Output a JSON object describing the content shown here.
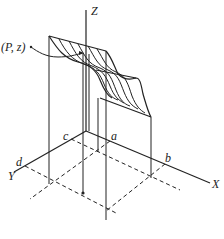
{
  "figure": {
    "type": "3D joint distribution surface diagram",
    "axes": {
      "z_label": "Z",
      "x_label": "X",
      "y_label": "Y"
    },
    "point_labels": {
      "P_z": "(P, z)",
      "a": "a",
      "b": "b",
      "c": "c",
      "d": "d"
    },
    "colors": {
      "stroke": "#222222",
      "background": "#ffffff"
    }
  }
}
